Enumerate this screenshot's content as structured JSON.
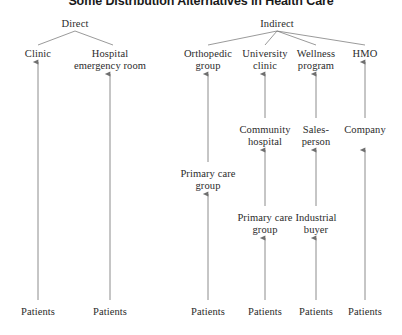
{
  "title": "Some Distribution Alternatives in Health Care",
  "colors": {
    "line": "#6f6f6f",
    "text": "#2b2b2b",
    "title": "#1a1a1a",
    "background": "#ffffff"
  },
  "diagram": {
    "type": "tree",
    "orientation": "bottom-up-arrows",
    "roots": [
      "Direct",
      "Indirect"
    ],
    "nodes": [
      {
        "id": "direct",
        "label": "Direct",
        "x": 75,
        "y": 18,
        "level": 0,
        "branch": "direct"
      },
      {
        "id": "indirect",
        "label": "Indirect",
        "x": 277,
        "y": 18,
        "level": 0,
        "branch": "indirect"
      },
      {
        "id": "clinic",
        "label": "Clinic",
        "x": 38,
        "y": 48,
        "level": 1,
        "branch": "direct"
      },
      {
        "id": "hospital-er",
        "label": "Hospital\nemergency room",
        "x": 110,
        "y": 48,
        "level": 1,
        "branch": "direct"
      },
      {
        "id": "orthopedic-group",
        "label": "Orthopedic\ngroup",
        "x": 208,
        "y": 48,
        "level": 1,
        "branch": "indirect"
      },
      {
        "id": "university-clinic",
        "label": "University\nclinic",
        "x": 265,
        "y": 48,
        "level": 1,
        "branch": "indirect"
      },
      {
        "id": "wellness-program",
        "label": "Wellness\nprogram",
        "x": 316,
        "y": 48,
        "level": 1,
        "branch": "indirect"
      },
      {
        "id": "hmo",
        "label": "HMO",
        "x": 365,
        "y": 48,
        "level": 1,
        "branch": "indirect"
      },
      {
        "id": "community-hospital",
        "label": "Community\nhospital",
        "x": 265,
        "y": 124,
        "level": 2,
        "branch": "indirect"
      },
      {
        "id": "salesperson",
        "label": "Sales-\nperson",
        "x": 316,
        "y": 124,
        "level": 2,
        "branch": "indirect"
      },
      {
        "id": "company",
        "label": "Company",
        "x": 365,
        "y": 124,
        "level": 2,
        "branch": "indirect"
      },
      {
        "id": "primary-care-1",
        "label": "Primary care\ngroup",
        "x": 208,
        "y": 168,
        "level": 3,
        "branch": "indirect"
      },
      {
        "id": "primary-care-2",
        "label": "Primary care\ngroup",
        "x": 265,
        "y": 212,
        "level": 4,
        "branch": "indirect"
      },
      {
        "id": "industrial-buyer",
        "label": "Industrial\nbuyer",
        "x": 316,
        "y": 212,
        "level": 4,
        "branch": "indirect"
      },
      {
        "id": "patients-1",
        "label": "Patients",
        "x": 38,
        "y": 306,
        "level": 5,
        "branch": "direct"
      },
      {
        "id": "patients-2",
        "label": "Patients",
        "x": 110,
        "y": 306,
        "level": 5,
        "branch": "direct"
      },
      {
        "id": "patients-3",
        "label": "Patients",
        "x": 208,
        "y": 306,
        "level": 5,
        "branch": "indirect"
      },
      {
        "id": "patients-4",
        "label": "Patients",
        "x": 265,
        "y": 306,
        "level": 5,
        "branch": "indirect"
      },
      {
        "id": "patients-5",
        "label": "Patients",
        "x": 316,
        "y": 306,
        "level": 5,
        "branch": "indirect"
      },
      {
        "id": "patients-6",
        "label": "Patients",
        "x": 365,
        "y": 306,
        "level": 5,
        "branch": "indirect"
      }
    ],
    "branch_edges": [
      {
        "from": "direct",
        "to": "clinic",
        "x1": 75,
        "y1": 31,
        "x2": 38,
        "y2": 45
      },
      {
        "from": "direct",
        "to": "hospital-er",
        "x1": 75,
        "y1": 31,
        "x2": 113,
        "y2": 45
      },
      {
        "from": "indirect",
        "to": "orthopedic-group",
        "x1": 277,
        "y1": 31,
        "x2": 208,
        "y2": 45
      },
      {
        "from": "indirect",
        "to": "university-clinic",
        "x1": 277,
        "y1": 31,
        "x2": 265,
        "y2": 45
      },
      {
        "from": "indirect",
        "to": "wellness-program",
        "x1": 277,
        "y1": 31,
        "x2": 316,
        "y2": 45
      },
      {
        "from": "indirect",
        "to": "hmo",
        "x1": 277,
        "y1": 31,
        "x2": 365,
        "y2": 45
      }
    ],
    "flow_arrows": [
      {
        "from": "patients-1",
        "to": "clinic",
        "x": 38,
        "y1": 300,
        "y2": 62
      },
      {
        "from": "patients-2",
        "to": "hospital-er",
        "x": 110,
        "y1": 300,
        "y2": 74
      },
      {
        "from": "patients-3",
        "to": "primary-care-1",
        "x": 208,
        "y1": 300,
        "y2": 194
      },
      {
        "from": "primary-care-1",
        "to": "orthopedic-group",
        "x": 208,
        "y1": 162,
        "y2": 74
      },
      {
        "from": "patients-4",
        "to": "primary-care-2",
        "x": 265,
        "y1": 300,
        "y2": 238
      },
      {
        "from": "primary-care-2",
        "to": "community-hospital",
        "x": 265,
        "y1": 206,
        "y2": 150
      },
      {
        "from": "community-hospital",
        "to": "university-clinic",
        "x": 265,
        "y1": 118,
        "y2": 74
      },
      {
        "from": "patients-5",
        "to": "industrial-buyer",
        "x": 316,
        "y1": 300,
        "y2": 238
      },
      {
        "from": "industrial-buyer",
        "to": "salesperson",
        "x": 316,
        "y1": 206,
        "y2": 150
      },
      {
        "from": "salesperson",
        "to": "wellness-program",
        "x": 316,
        "y1": 118,
        "y2": 74
      },
      {
        "from": "patients-6",
        "to": "company",
        "x": 365,
        "y1": 300,
        "y2": 150
      },
      {
        "from": "company",
        "to": "hmo",
        "x": 365,
        "y1": 118,
        "y2": 62
      }
    ]
  }
}
